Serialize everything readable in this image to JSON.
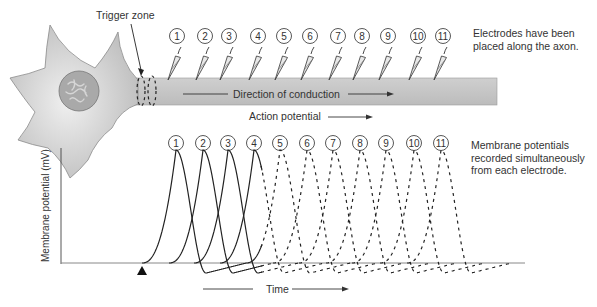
{
  "figure": {
    "trigger_zone_label": "Trigger zone",
    "axon_label": "Direction of conduction",
    "action_potential_label": "Action potential",
    "electrodes_note": [
      "Electrodes have been",
      "placed along the axon."
    ],
    "recordings_note": [
      "Membrane potentials",
      "recorded simultaneously",
      "from each electrode."
    ],
    "y_axis_label": "Membrane potential (mV)",
    "x_axis_label": "Time",
    "stimulus_marker": "triangle"
  },
  "electrodes": [
    {
      "label": "1",
      "x": 177
    },
    {
      "label": "2",
      "x": 205
    },
    {
      "label": "3",
      "x": 229
    },
    {
      "label": "4",
      "x": 258
    },
    {
      "label": "5",
      "x": 284
    },
    {
      "label": "6",
      "x": 310
    },
    {
      "label": "7",
      "x": 338
    },
    {
      "label": "8",
      "x": 362
    },
    {
      "label": "9",
      "x": 388
    },
    {
      "label": "10",
      "x": 418
    },
    {
      "label": "11",
      "x": 443
    }
  ],
  "traces": [
    {
      "label": "1",
      "peak_x": 176
    },
    {
      "label": "2",
      "peak_x": 203
    },
    {
      "label": "3",
      "peak_x": 228
    },
    {
      "label": "4",
      "peak_x": 254
    },
    {
      "label": "5",
      "peak_x": 280
    },
    {
      "label": "6",
      "peak_x": 307
    },
    {
      "label": "7",
      "peak_x": 333
    },
    {
      "label": "8",
      "peak_x": 360
    },
    {
      "label": "9",
      "peak_x": 386
    },
    {
      "label": "10",
      "peak_x": 414
    },
    {
      "label": "11",
      "peak_x": 441
    }
  ],
  "colors": {
    "cell_fill": "#cfcfcf",
    "nucleus_fill": "#a8a8a8",
    "axon_fill": "#c6c6c6",
    "line": "#222222"
  }
}
